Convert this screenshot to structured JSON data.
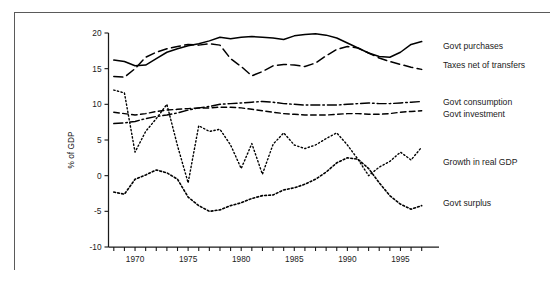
{
  "figure": {
    "name": "government-spending-gdp-chart",
    "has_outer_frame": true
  },
  "chart_data": {
    "type": "line",
    "title": "",
    "xlabel": "",
    "ylabel": "% of GDP",
    "xlim": [
      1967.5,
      1997.5
    ],
    "ylim": [
      -10,
      20
    ],
    "ytick_values": [
      20,
      15,
      10,
      5,
      0,
      -5,
      -10
    ],
    "ytick_labels": [
      "20",
      "15",
      "10",
      "5",
      "0",
      "-5",
      "-10"
    ],
    "xtick_values": [
      1968,
      1969,
      1970,
      1971,
      1972,
      1973,
      1974,
      1975,
      1976,
      1977,
      1978,
      1979,
      1980,
      1981,
      1982,
      1983,
      1984,
      1985,
      1986,
      1987,
      1988,
      1989,
      1990,
      1991,
      1992,
      1993,
      1994,
      1995,
      1996,
      1997
    ],
    "xtick_labeled": [
      1970,
      1975,
      1980,
      1985,
      1990,
      1995
    ],
    "xtick_labels": [
      "1970",
      "1975",
      "1980",
      "1985",
      "1990",
      "1995"
    ],
    "grid": false,
    "legend_position": "right-inline",
    "x": [
      1968,
      1969,
      1970,
      1971,
      1972,
      1973,
      1974,
      1975,
      1976,
      1977,
      1978,
      1979,
      1980,
      1981,
      1982,
      1983,
      1984,
      1985,
      1986,
      1987,
      1988,
      1989,
      1990,
      1991,
      1992,
      1993,
      1994,
      1995,
      1996,
      1997
    ],
    "series": [
      {
        "name": "Govt purchases",
        "style": "solid",
        "label_x": 1998.2,
        "label_y": 18.2,
        "values": [
          16.2,
          16.0,
          15.4,
          15.5,
          16.4,
          17.3,
          17.8,
          18.2,
          18.5,
          18.9,
          19.4,
          19.2,
          19.4,
          19.5,
          19.4,
          19.3,
          19.1,
          19.6,
          19.8,
          19.9,
          19.7,
          19.3,
          18.6,
          17.9,
          17.2,
          16.7,
          16.6,
          17.3,
          18.4,
          18.8
        ]
      },
      {
        "name": "Taxes net of transfers",
        "style": "dashed",
        "label_x": 1998.2,
        "label_y": 15.5,
        "values": [
          13.9,
          13.8,
          15.0,
          16.6,
          17.3,
          17.8,
          18.1,
          18.4,
          18.3,
          18.5,
          18.3,
          16.4,
          15.3,
          14.0,
          14.6,
          15.4,
          15.6,
          15.5,
          15.3,
          15.8,
          16.8,
          17.7,
          18.1,
          17.9,
          17.2,
          16.5,
          16.0,
          15.6,
          15.2,
          14.9
        ]
      },
      {
        "name": "Govt consumption",
        "style": "dashdot",
        "label_x": 1998.2,
        "label_y": 10.4,
        "values": [
          7.3,
          7.4,
          7.6,
          8.0,
          8.3,
          8.5,
          8.8,
          9.2,
          9.5,
          9.7,
          10.0,
          10.1,
          10.2,
          10.3,
          10.4,
          10.3,
          10.1,
          10.0,
          9.9,
          9.9,
          9.9,
          9.9,
          10.0,
          10.1,
          10.2,
          10.1,
          10.1,
          10.2,
          10.3,
          10.4
        ]
      },
      {
        "name": "Govt investment",
        "style": "dashed-short",
        "label_x": 1998.2,
        "label_y": 8.7,
        "values": [
          8.9,
          8.7,
          8.5,
          8.7,
          9.0,
          9.2,
          9.3,
          9.4,
          9.5,
          9.5,
          9.6,
          9.6,
          9.5,
          9.3,
          9.1,
          8.9,
          8.7,
          8.6,
          8.5,
          8.5,
          8.5,
          8.6,
          8.7,
          8.7,
          8.6,
          8.6,
          8.7,
          8.9,
          9.0,
          9.1
        ]
      },
      {
        "name": "Growth in real GDP",
        "style": "dotted",
        "label_x": 1998.2,
        "label_y": 1.9,
        "values": [
          12.0,
          11.6,
          3.3,
          6.2,
          8.0,
          10.0,
          4.2,
          -1.0,
          7.0,
          6.2,
          6.5,
          4.3,
          1.0,
          4.5,
          0.2,
          4.4,
          6.0,
          4.3,
          3.8,
          4.3,
          5.2,
          6.0,
          4.3,
          2.3,
          0.0,
          1.2,
          2.0,
          3.3,
          2.2,
          4.0
        ]
      },
      {
        "name": "Govt surplus",
        "style": "dotted-dense",
        "label_x": 1998.2,
        "label_y": -3.8,
        "values": [
          -2.3,
          -2.6,
          -0.5,
          0.1,
          0.8,
          0.4,
          -0.5,
          -3.0,
          -4.2,
          -5.0,
          -4.8,
          -4.2,
          -3.8,
          -3.2,
          -2.8,
          -2.7,
          -2.0,
          -1.7,
          -1.2,
          -0.5,
          0.5,
          1.8,
          2.5,
          2.3,
          1.0,
          -1.0,
          -2.8,
          -4.0,
          -4.7,
          -4.2
        ]
      }
    ]
  },
  "legend": {
    "items": [
      {
        "label": "Govt purchases",
        "style": "solid"
      },
      {
        "label": "Taxes net of transfers",
        "style": "dashed"
      },
      {
        "label": "Govt consumption",
        "style": "dashdot"
      },
      {
        "label": "Govt investment",
        "style": "dashed-short"
      },
      {
        "label": "Growth in real GDP",
        "style": "dotted"
      },
      {
        "label": "Govt surplus",
        "style": "dotted-dense"
      }
    ]
  }
}
